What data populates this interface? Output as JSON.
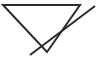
{
  "figure": {
    "canvas": {
      "width": 102,
      "height": 58,
      "background_color": "#ffffff"
    },
    "style": {
      "stroke_color": "#2b2b2b",
      "stroke_width": 2,
      "fill": "none"
    },
    "shapes": [
      {
        "name": "triangle",
        "type": "polygon",
        "closed": true,
        "points": "3,5 80,5 47,52",
        "vertices": [
          {
            "label": "top-left",
            "x": 3,
            "y": 5
          },
          {
            "label": "top-right",
            "x": 80,
            "y": 5
          },
          {
            "label": "bottom-apex",
            "x": 47,
            "y": 52
          }
        ]
      },
      {
        "name": "slash-line",
        "type": "line",
        "closed": false,
        "points": "30,55 95,6",
        "vertices": [
          {
            "label": "lower-left-end",
            "x": 30,
            "y": 55
          },
          {
            "label": "upper-right-end",
            "x": 95,
            "y": 6
          }
        ]
      }
    ],
    "intersections": [
      {
        "label": "slash-crosses-triangle-right-edge",
        "x": 40,
        "y": 45
      }
    ]
  }
}
